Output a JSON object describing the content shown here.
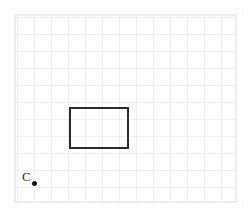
{
  "figure": {
    "background_color": "#ffffff",
    "plate_color": "#ffffff",
    "grid": {
      "line_color": "#dedede",
      "minor_line_color": "#ececec",
      "cell_size_px": 17,
      "origin_x_px": 15,
      "origin_y_px": 15,
      "columns": 13,
      "rows": 11,
      "width_px": 221,
      "height_px": 187,
      "show_border": true
    },
    "rectangle": {
      "name": "rectangle-shape",
      "stroke_color": "#2b2b2b",
      "fill": "none",
      "stroke_width_px": 2,
      "x_px": 70,
      "y_px": 108,
      "width_px": 58,
      "height_px": 40,
      "grid_units_width": 3.4,
      "grid_units_height": 2.4
    },
    "point": {
      "name": "point-c",
      "label": "C",
      "label_color": "#2c2c2c",
      "dot_color": "#171717",
      "label_x_px": 22,
      "label_y_px": 170,
      "dot_x_px": 32,
      "dot_y_px": 181,
      "dot_diameter_px": 5
    }
  }
}
